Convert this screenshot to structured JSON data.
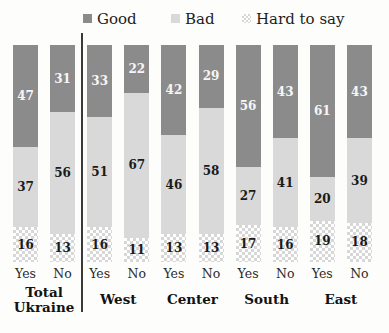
{
  "chart_data": {
    "type": "bar",
    "stacking": "100-percent-stacked-vertical",
    "title": "",
    "unit": "percent",
    "ylim": [
      0,
      100
    ],
    "grid": false,
    "legend_position": "top",
    "series_order_top_to_bottom": [
      "Good",
      "Bad",
      "Hard to say"
    ],
    "legend": [
      {
        "label": "Good",
        "color": "#8b8b8b",
        "pattern": "solid"
      },
      {
        "label": "Bad",
        "color": "#d9d9d9",
        "pattern": "solid"
      },
      {
        "label": "Hard to say",
        "color": "#d7d7d7",
        "pattern": "checkerboard"
      }
    ],
    "groups": [
      {
        "label": "Total Ukraine",
        "bars": [
          {
            "label": "Yes",
            "values": [
              47,
              37,
              16
            ]
          },
          {
            "label": "No",
            "values": [
              31,
              56,
              13
            ]
          }
        ]
      },
      {
        "label": "West",
        "bars": [
          {
            "label": "Yes",
            "values": [
              33,
              51,
              16
            ]
          },
          {
            "label": "No",
            "values": [
              22,
              67,
              11
            ]
          }
        ]
      },
      {
        "label": "Center",
        "bars": [
          {
            "label": "Yes",
            "values": [
              42,
              46,
              13
            ]
          },
          {
            "label": "No",
            "values": [
              29,
              58,
              13
            ]
          }
        ]
      },
      {
        "label": "South",
        "bars": [
          {
            "label": "Yes",
            "values": [
              56,
              27,
              17
            ]
          },
          {
            "label": "No",
            "values": [
              43,
              41,
              16
            ]
          }
        ]
      },
      {
        "label": "East",
        "bars": [
          {
            "label": "Yes",
            "values": [
              61,
              20,
              19
            ]
          },
          {
            "label": "No",
            "values": [
              43,
              39,
              18
            ]
          }
        ]
      }
    ],
    "divider_after_group": "Total Ukraine"
  },
  "style": {
    "background": "#fdfdfc",
    "divider_color": "#3a3a3a",
    "value_label_on_dark": "#f6f6f6",
    "value_label_on_light": "#1b1b1b"
  }
}
